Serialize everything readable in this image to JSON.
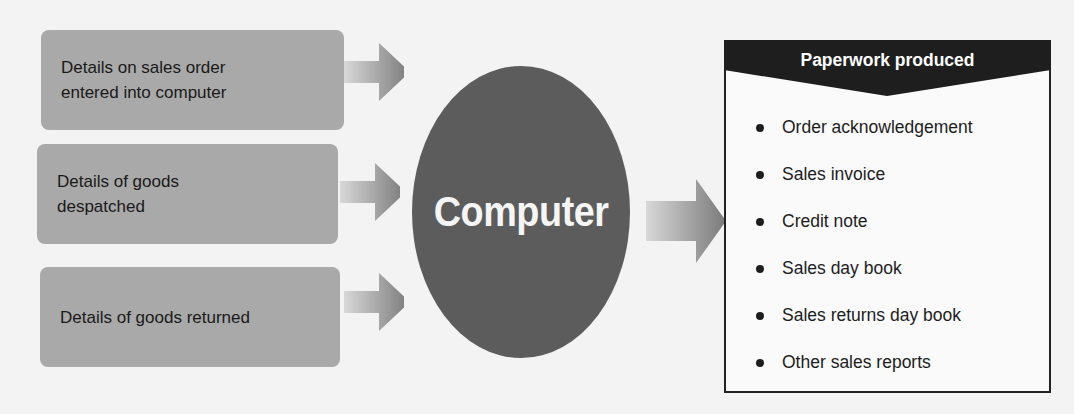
{
  "inputs": [
    {
      "label_line1": "Details on sales order",
      "label_line2": "entered into computer"
    },
    {
      "label_line1": "Details of goods",
      "label_line2": "despatched"
    },
    {
      "label_line1": "Details of goods returned",
      "label_line2": ""
    }
  ],
  "processor": {
    "label": "Computer"
  },
  "output": {
    "title": "Paperwork produced",
    "items": [
      "Order acknowledgement",
      "Sales invoice",
      "Credit note",
      "Sales day book",
      "Sales returns day book",
      "Other sales reports"
    ]
  },
  "colors": {
    "box": "#a9a9a9",
    "ellipse": "#5c5c5c",
    "header": "#1e1e1e"
  }
}
